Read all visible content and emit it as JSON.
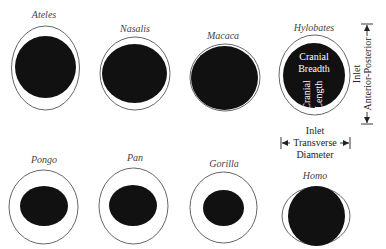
{
  "diagram": {
    "colors": {
      "inlet_outline": "#555555",
      "cranium_fill": "#111111",
      "label_text": "#444444"
    },
    "species": [
      {
        "name": "Ateles",
        "label_pos": [
          44,
          18
        ],
        "outer": {
          "cx": 45.5,
          "cy": 68,
          "rx": 34,
          "ry": 42
        },
        "inner": {
          "cx": 45.5,
          "cy": 67,
          "rx": 30.5,
          "ry": 31
        }
      },
      {
        "name": "Nasalis",
        "label_pos": [
          135,
          32
        ],
        "outer": {
          "cx": 135,
          "cy": 73.5,
          "rx": 35,
          "ry": 36.5
        },
        "inner": {
          "cx": 134.5,
          "cy": 73.5,
          "rx": 32.5,
          "ry": 29.5
        }
      },
      {
        "name": "Macaca",
        "label_pos": [
          223,
          39
        ],
        "outer": {
          "cx": 225,
          "cy": 77.5,
          "rx": 35,
          "ry": 33.5
        },
        "inner": {
          "cx": 224.5,
          "cy": 78,
          "rx": 33.5,
          "ry": 32
        }
      },
      {
        "name": "Hylobates",
        "label_pos": [
          314,
          31
        ],
        "outer": {
          "cx": 314.5,
          "cy": 75,
          "rx": 35.5,
          "ry": 40
        },
        "inner": {
          "cx": 314,
          "cy": 75.5,
          "rx": 31,
          "ry": 32.5
        }
      },
      {
        "name": "Pongo",
        "label_pos": [
          44,
          163
        ],
        "outer": {
          "cx": 43.5,
          "cy": 207,
          "rx": 34.5,
          "ry": 37
        },
        "inner": {
          "cx": 44,
          "cy": 206,
          "rx": 24,
          "ry": 20
        }
      },
      {
        "name": "Pan",
        "label_pos": [
          135,
          161
        ],
        "outer": {
          "cx": 133.5,
          "cy": 206,
          "rx": 34.5,
          "ry": 38
        },
        "inner": {
          "cx": 133,
          "cy": 205.5,
          "rx": 24,
          "ry": 20.5
        }
      },
      {
        "name": "Gorilla",
        "label_pos": [
          224,
          167
        ],
        "outer": {
          "cx": 223.5,
          "cy": 207.5,
          "rx": 33.5,
          "ry": 35.5
        },
        "inner": {
          "cx": 223.5,
          "cy": 208,
          "rx": 20.5,
          "ry": 18
        }
      },
      {
        "name": "Homo",
        "label_pos": [
          315,
          179
        ],
        "outer": {
          "cx": 316,
          "cy": 216,
          "rx": 34,
          "ry": 29
        },
        "inner": {
          "cx": 316.5,
          "cy": 216,
          "rx": 28.5,
          "ry": 30
        }
      }
    ],
    "hylobates_annotations": {
      "breadth_line1": "Cranial",
      "breadth_line2": "Breadth",
      "length_line1": "Cranial",
      "length_line2": "Length"
    },
    "ap_annotation": {
      "line1": "Inlet",
      "line2": "Anterior-Posterior"
    },
    "transverse_annotation": {
      "line1": "Inlet",
      "line2": "Transverse",
      "line3": "Diameter"
    }
  }
}
